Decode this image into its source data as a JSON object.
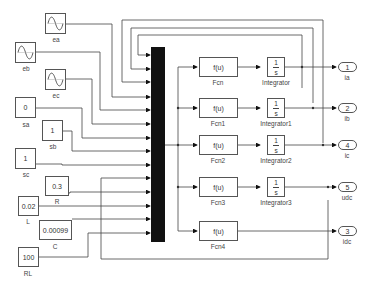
{
  "diagram": {
    "type": "simulink-block-diagram",
    "sources": {
      "sine": [
        {
          "id": "ea",
          "label": "ea"
        },
        {
          "id": "eb",
          "label": "eb"
        },
        {
          "id": "ec",
          "label": "ec"
        }
      ],
      "constants": [
        {
          "id": "sa",
          "label": "sa",
          "value": "0"
        },
        {
          "id": "sb",
          "label": "sb",
          "value": "1"
        },
        {
          "id": "sc",
          "label": "sc",
          "value": "1"
        },
        {
          "id": "R",
          "label": "R",
          "value": "0.3"
        },
        {
          "id": "L",
          "label": "L",
          "value": "0.02"
        },
        {
          "id": "C",
          "label": "C",
          "value": "0.00099"
        },
        {
          "id": "RL",
          "label": "RL",
          "value": "100"
        }
      ]
    },
    "mux": {
      "label": "Mux",
      "inputs": 14
    },
    "fcn_blocks": [
      {
        "label": "Fcn",
        "expr": "f(u)"
      },
      {
        "label": "Fcn1",
        "expr": "f(u)"
      },
      {
        "label": "Fcn2",
        "expr": "f(u)"
      },
      {
        "label": "Fcn3",
        "expr": "f(u)"
      },
      {
        "label": "Fcn4",
        "expr": "f(u)"
      }
    ],
    "integrators": [
      {
        "label": "Integrator",
        "num": "1",
        "den": "s"
      },
      {
        "label": "Integrator1",
        "num": "1",
        "den": "s"
      },
      {
        "label": "Integrator2",
        "num": "1",
        "den": "s"
      },
      {
        "label": "Integrator3",
        "num": "1",
        "den": "s"
      }
    ],
    "outports": [
      {
        "label": "ia",
        "number": "1"
      },
      {
        "label": "ib",
        "number": "2"
      },
      {
        "label": "ic",
        "number": "4"
      },
      {
        "label": "udc",
        "number": "5"
      },
      {
        "label": "idc",
        "number": "3"
      }
    ]
  }
}
